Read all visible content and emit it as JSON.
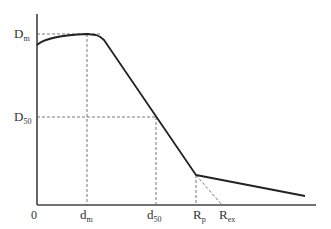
{
  "diagram": {
    "type": "dose-depth curve",
    "y_labels": {
      "dm": {
        "main": "D",
        "sub": "m"
      },
      "d50": {
        "main": "D",
        "sub": "50"
      }
    },
    "x_labels": {
      "origin": "0",
      "dm": {
        "main": "d",
        "sub": "m"
      },
      "d50": {
        "main": "d",
        "sub": "50"
      },
      "rp": {
        "main": "R",
        "sub": "p"
      },
      "rex": {
        "main": "R",
        "sub": "ex"
      }
    },
    "colors": {
      "line": "#222222",
      "dashed": "#555555",
      "axis": "#333333"
    }
  }
}
